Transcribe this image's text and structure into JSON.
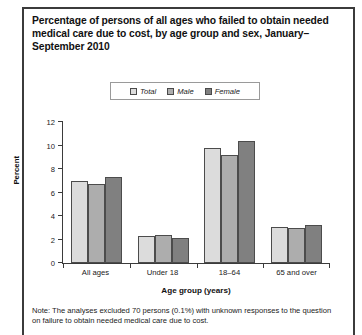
{
  "title": "Percentage of persons of all ages who failed to obtain needed medical care due to cost, by age group and sex, January–September 2010",
  "note": "Note: The analyses excluded 70 persons (0.1%) with unknown responses to the question on failure to obtain needed medical care due to cost.",
  "colors": {
    "total": "#dcdcdc",
    "male": "#adadad",
    "female": "#808080",
    "axis": "#3b3b3b",
    "frame": "#3b3b3b",
    "text": "#1a1a1a"
  },
  "legend": {
    "items": [
      {
        "label": "Total",
        "color": "#dcdcdc"
      },
      {
        "label": "Male",
        "color": "#adadad"
      },
      {
        "label": "Female",
        "color": "#808080"
      }
    ]
  },
  "chart_data": {
    "type": "bar",
    "title": "Percentage of persons of all ages who failed to obtain needed medical care due to cost, by age group and sex, January–September 2010",
    "xlabel": "Age group (years)",
    "ylabel": "Percent",
    "ylim": [
      0,
      12
    ],
    "yticks": [
      0,
      2,
      4,
      6,
      8,
      10,
      12
    ],
    "ytick_labels": [
      "0",
      "2",
      "4",
      "6",
      "8",
      "10",
      "12"
    ],
    "grid": false,
    "legend_position": "top-center",
    "categories": [
      "All ages",
      "Under 18",
      "18–64",
      "65 and over"
    ],
    "series": [
      {
        "name": "Total",
        "color": "#dcdcdc",
        "values": [
          7.0,
          2.3,
          9.8,
          3.1
        ]
      },
      {
        "name": "Male",
        "color": "#adadad",
        "values": [
          6.7,
          2.4,
          9.2,
          3.0
        ]
      },
      {
        "name": "Female",
        "color": "#808080",
        "values": [
          7.3,
          2.1,
          10.4,
          3.2
        ]
      }
    ]
  }
}
